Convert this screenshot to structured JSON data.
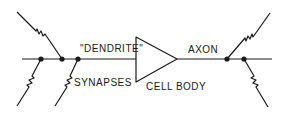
{
  "diagram": {
    "labels": {
      "dendrite": "\"DENDRITE\"",
      "synapses": "SYNAPSES",
      "cell_body": "CELL BODY",
      "axon": "AXON"
    },
    "colors": {
      "stroke": "#1a1a1a",
      "background": "#ffffff"
    },
    "nodes": [
      {
        "id": "synapse-1",
        "x": 41,
        "y": 59
      },
      {
        "id": "synapse-2",
        "x": 62,
        "y": 59
      },
      {
        "id": "synapse-3",
        "x": 78,
        "y": 59
      },
      {
        "id": "axon-terminal-1",
        "x": 227,
        "y": 59
      },
      {
        "id": "axon-terminal-2",
        "x": 244,
        "y": 59
      }
    ],
    "elements": [
      "input lines with resistor-like synapse symbols",
      "dendrite line",
      "triangle cell body",
      "axon line",
      "output branches"
    ]
  }
}
